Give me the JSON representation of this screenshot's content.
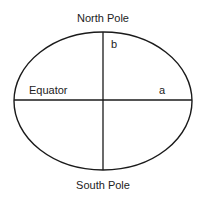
{
  "diagram": {
    "labels": {
      "north": "North Pole",
      "south": "South Pole",
      "equator": "Equator",
      "semi_major": "a",
      "semi_minor": "b"
    },
    "colors": {
      "stroke": "#1a1a1a",
      "text": "#222222",
      "background": "#ffffff"
    },
    "ellipse": {
      "cx": 103,
      "cy": 101,
      "rx": 89,
      "ry": 69
    }
  }
}
